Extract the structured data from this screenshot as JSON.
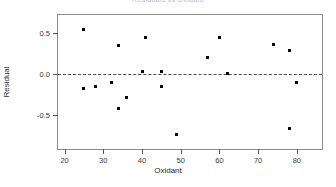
{
  "chart_data": {
    "type": "scatter",
    "title": "Residuals vs Oxidant",
    "xlabel": "Oxidant",
    "ylabel": "Residual",
    "xlim": [
      18.3,
      86.5
    ],
    "ylim": [
      -0.92,
      0.72
    ],
    "xticks": [
      20,
      30,
      40,
      50,
      60,
      70,
      80
    ],
    "xtick_labels": [
      "20",
      "30",
      "40",
      "50",
      "60",
      "70",
      "80"
    ],
    "yticks": [
      0.5,
      0.0,
      -0.5
    ],
    "ytick_labels": [
      "0.5",
      "0.0",
      "-0.5"
    ],
    "grid": false,
    "legend": "none",
    "reference_line": {
      "axis": "y",
      "value": 0.0,
      "style": "dashed",
      "color": "#4a4a4a"
    },
    "marker": {
      "shape": "square",
      "color": "#000000",
      "size": 3
    },
    "x": [
      25,
      25,
      28,
      32,
      34,
      34,
      36,
      40,
      41,
      45,
      45,
      49,
      57,
      60,
      62,
      74,
      78,
      78,
      80
    ],
    "y": [
      0.54,
      -0.18,
      -0.15,
      -0.11,
      0.35,
      -0.43,
      -0.29,
      0.03,
      0.44,
      0.03,
      -0.16,
      -0.74,
      0.2,
      0.44,
      0.0,
      0.36,
      0.28,
      -0.67,
      -0.1
    ],
    "points": [
      {
        "x": 25,
        "y": 0.54
      },
      {
        "x": 25,
        "y": -0.18
      },
      {
        "x": 28,
        "y": -0.15
      },
      {
        "x": 32,
        "y": -0.11
      },
      {
        "x": 34,
        "y": 0.35
      },
      {
        "x": 34,
        "y": -0.43
      },
      {
        "x": 36,
        "y": -0.29
      },
      {
        "x": 40,
        "y": 0.03
      },
      {
        "x": 41,
        "y": 0.44
      },
      {
        "x": 45,
        "y": 0.03
      },
      {
        "x": 45,
        "y": -0.16
      },
      {
        "x": 49,
        "y": -0.74
      },
      {
        "x": 57,
        "y": 0.2
      },
      {
        "x": 60,
        "y": 0.44
      },
      {
        "x": 62,
        "y": 0.0
      },
      {
        "x": 74,
        "y": 0.36
      },
      {
        "x": 78,
        "y": 0.28
      },
      {
        "x": 78,
        "y": -0.67
      },
      {
        "x": 80,
        "y": -0.1
      }
    ]
  }
}
